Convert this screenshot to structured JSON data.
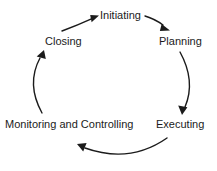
{
  "diagram": {
    "background_color": "#ffffff",
    "stroke_color": "#1b1b1b",
    "text_color": "#1b1b1b",
    "nodes": [
      {
        "id": "initiating",
        "label": "Initiating"
      },
      {
        "id": "planning",
        "label": "Planning"
      },
      {
        "id": "executing",
        "label": "Executing"
      },
      {
        "id": "monitoring",
        "label": "Monitoring and Controlling"
      },
      {
        "id": "closing",
        "label": "Closing"
      }
    ],
    "arrows": [
      {
        "id": "closing-to-initiating",
        "from": "Closing",
        "to": "Initiating",
        "icon": "curved-arrow-icon"
      },
      {
        "id": "initiating-to-planning",
        "from": "Initiating",
        "to": "Planning",
        "icon": "curved-arrow-icon"
      },
      {
        "id": "planning-to-executing",
        "from": "Planning",
        "to": "Executing",
        "icon": "curved-arrow-icon"
      },
      {
        "id": "executing-to-monitoring",
        "from": "Executing",
        "to": "Monitoring and Controlling",
        "icon": "curved-arrow-icon"
      },
      {
        "id": "monitoring-to-closing",
        "from": "Monitoring and Controlling",
        "to": "Closing",
        "icon": "curved-arrow-icon"
      }
    ]
  }
}
